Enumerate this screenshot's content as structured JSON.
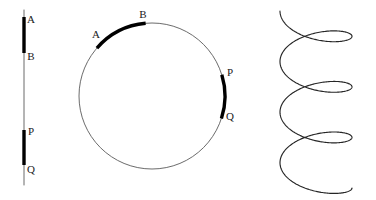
{
  "figure": {
    "background_color": "#ffffff",
    "stroke_color_thin": "#2b2b2b",
    "stroke_color_thick": "#000000",
    "label_color": "#1a1a1a",
    "panels": [
      {
        "id": "line-panel",
        "name": "straight-line-with-segments",
        "shape": "line",
        "labels": [
          "A",
          "B",
          "P",
          "Q"
        ]
      },
      {
        "id": "circle-panel",
        "name": "circle-with-arcs",
        "shape": "circle",
        "labels": [
          "A",
          "B",
          "P",
          "Q"
        ]
      },
      {
        "id": "helix-panel",
        "name": "helix-coil",
        "shape": "helix",
        "labels": []
      }
    ]
  },
  "line_panel": {
    "axis": {
      "x": 24,
      "y_top": 10,
      "y_bottom": 185
    },
    "segments": [
      {
        "name": "segment-AB",
        "from_label": "A",
        "to_label": "B",
        "y_start": 17,
        "y_end": 53
      },
      {
        "name": "segment-PQ",
        "from_label": "P",
        "to_label": "Q",
        "y_start": 130,
        "y_end": 165
      }
    ],
    "labels": [
      {
        "text": "A",
        "x": 31,
        "y": 20
      },
      {
        "text": "B",
        "x": 31,
        "y": 57
      },
      {
        "text": "P",
        "x": 31,
        "y": 132
      },
      {
        "text": "Q",
        "x": 31,
        "y": 170
      }
    ]
  },
  "circle_panel": {
    "center": {
      "x": 152,
      "y": 96
    },
    "radius": 73,
    "arcs": [
      {
        "name": "arc-AB",
        "from_label": "A",
        "to_label": "B",
        "start_angle_deg": 221,
        "end_angle_deg": 265
      },
      {
        "name": "arc-PQ",
        "from_label": "P",
        "to_label": "Q",
        "start_angle_deg": 343,
        "end_angle_deg": 18
      }
    ],
    "labels": [
      {
        "text": "A",
        "x": 96,
        "y": 35
      },
      {
        "text": "B",
        "x": 143,
        "y": 15
      },
      {
        "text": "P",
        "x": 230,
        "y": 73
      },
      {
        "text": "Q",
        "x": 230,
        "y": 117
      }
    ]
  },
  "helix_panel": {
    "center_x": 316,
    "radius_x": 36,
    "radius_y": 16,
    "y_start": 11,
    "y_end": 188,
    "turns": 3.5,
    "label": ""
  }
}
